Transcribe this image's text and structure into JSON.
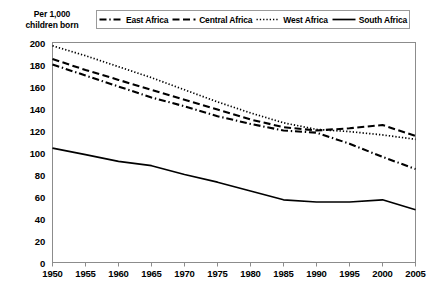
{
  "axis_title": {
    "line1": "Per 1,000",
    "line2": "children born"
  },
  "legend": {
    "items": [
      {
        "label": "East Africa",
        "style": "dash-dot",
        "color": "#000000"
      },
      {
        "label": "Central Africa",
        "style": "dashed",
        "color": "#000000"
      },
      {
        "label": "West Africa",
        "style": "dotted",
        "color": "#000000"
      },
      {
        "label": "South Africa",
        "style": "solid",
        "color": "#000000"
      }
    ]
  },
  "chart_data": {
    "type": "line",
    "title": "",
    "subtitle": "",
    "xlabel": "",
    "ylabel": "Per 1,000 children born",
    "x": [
      1950,
      1955,
      1960,
      1965,
      1970,
      1975,
      1980,
      1985,
      1990,
      1995,
      2000,
      2005
    ],
    "xticklabels": [
      "1950",
      "1955",
      "1960",
      "1965",
      "1970",
      "1975",
      "1980",
      "1985",
      "1990",
      "1995",
      "2000",
      "2005"
    ],
    "yticks": [
      0,
      20,
      40,
      60,
      80,
      100,
      120,
      140,
      160,
      180,
      200
    ],
    "yticklabels": [
      "0",
      "20",
      "40",
      "60",
      "80",
      "100",
      "120",
      "140",
      "160",
      "180",
      "200"
    ],
    "xlim": [
      1950,
      2005
    ],
    "ylim": [
      0,
      200
    ],
    "grid": false,
    "legend_position": "top",
    "series": [
      {
        "name": "East Africa",
        "style": "dash-dot",
        "values": [
          180,
          170,
          160,
          150,
          142,
          133,
          126,
          120,
          118,
          108,
          96,
          85
        ]
      },
      {
        "name": "Central Africa",
        "style": "dashed",
        "values": [
          185,
          175,
          166,
          157,
          148,
          139,
          130,
          123,
          120,
          122,
          125,
          115
        ]
      },
      {
        "name": "West Africa",
        "style": "dotted",
        "values": [
          197,
          188,
          178,
          168,
          157,
          146,
          136,
          127,
          121,
          119,
          116,
          112
        ]
      },
      {
        "name": "South Africa",
        "style": "solid",
        "values": [
          104,
          98,
          92,
          88,
          80,
          73,
          65,
          57,
          55,
          55,
          57,
          48
        ]
      }
    ]
  }
}
